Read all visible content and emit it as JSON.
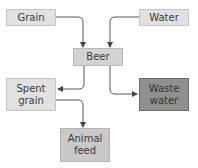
{
  "nodes": {
    "grain": {
      "label": "Grain"
    },
    "water": {
      "label": "Water"
    },
    "beer": {
      "label": "Beer"
    },
    "spent_grain": {
      "label": "Spent\ngrain"
    },
    "waste_water": {
      "label": "Waste\nwater"
    },
    "animal_feed": {
      "label": "Animal\nfeed"
    }
  },
  "edges": [
    {
      "from": "Grain",
      "to": "Beer"
    },
    {
      "from": "Water",
      "to": "Beer"
    },
    {
      "from": "Beer",
      "to": "Spent grain"
    },
    {
      "from": "Beer",
      "to": "Waste water"
    },
    {
      "from": "Spent grain",
      "to": "Animal feed"
    }
  ],
  "colors": {
    "input_fill": "#e1e1e1",
    "product_fill": "#d3d3d3",
    "byproduct_fill": "#c9c9c9",
    "waste_fill": "#8f8f8f",
    "connector": "#555555"
  }
}
